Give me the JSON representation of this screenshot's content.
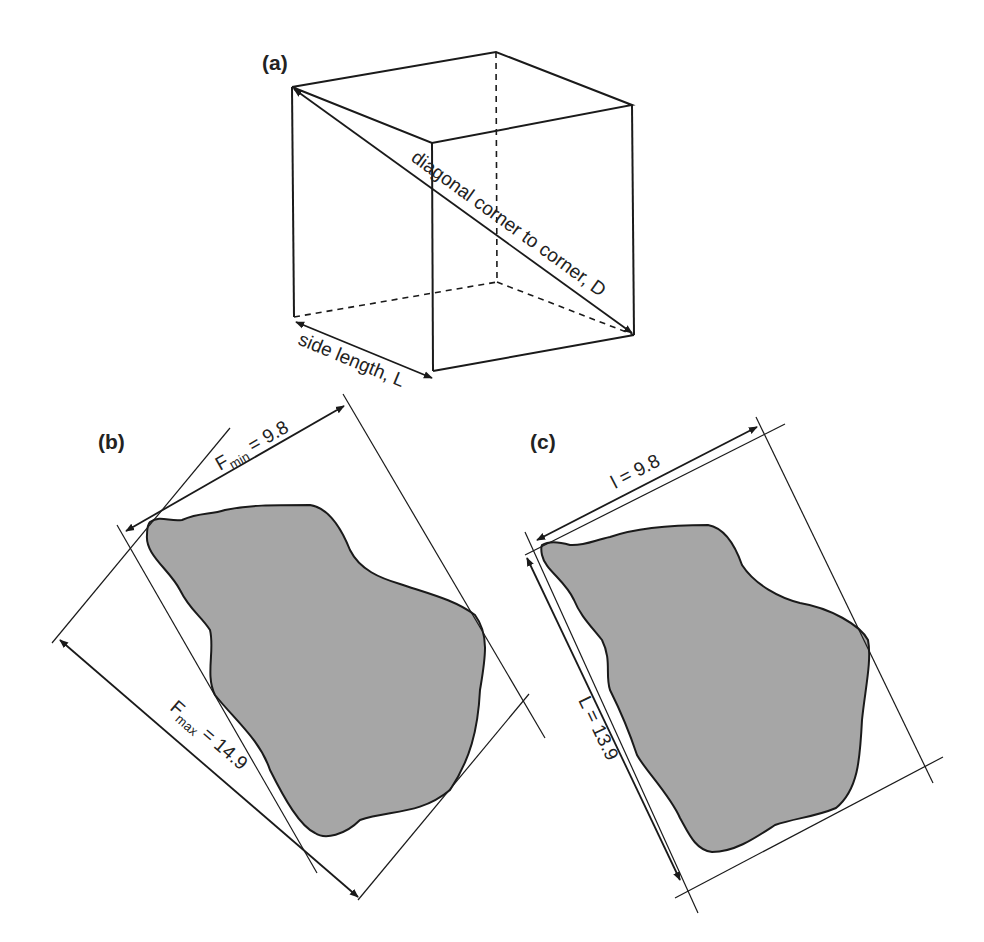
{
  "figure": {
    "panels": [
      {
        "id": "a",
        "label": "(a)",
        "description": "cube",
        "annotations": {
          "diagonal": "diagonal corner to corner, D",
          "side": "side length, L"
        }
      },
      {
        "id": "b",
        "label": "(b)",
        "description": "irregular particle with Feret diameters",
        "annotations": {
          "fmin_symbol": "F",
          "fmin_sub": "min",
          "fmin_value": " = 9.8",
          "fmax_symbol": "F",
          "fmax_sub": "max",
          "fmax_value": " = 14.9"
        }
      },
      {
        "id": "c",
        "label": "(c)",
        "description": "irregular particle with bounding box length and width",
        "annotations": {
          "width_label": "l = 9.8",
          "length_label": "L = 13.9"
        }
      }
    ],
    "colors": {
      "line": "#1a1a1a",
      "particle_fill": "#a6a6a6",
      "background": "#ffffff"
    }
  }
}
